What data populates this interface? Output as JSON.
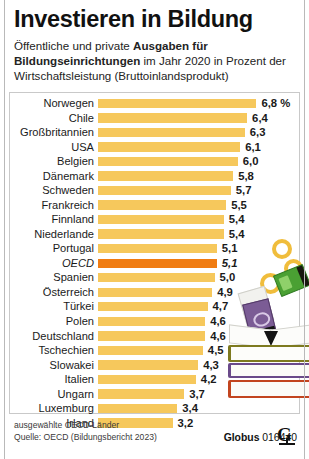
{
  "title": "Investieren in Bildung",
  "subtitle": {
    "part1": "Öffentliche und private ",
    "bold1": "Ausgaben für Bildungseinrichtungen",
    "part2": " im Jahr 2020 in Prozent der Wirtschaftsleistung (Bruttoinlandsprodukt)"
  },
  "footer": {
    "note": "ausgewählte OECD-Länder",
    "source": "Quelle: OECD (Bildungsbericht 2023)",
    "brand": "Globus",
    "id": "016440",
    "logo_icon": "globus-globe-icon"
  },
  "colors": {
    "bar": "#f6c85c",
    "highlight": "#f07c12",
    "text": "#1a1a1a"
  },
  "illustration": {
    "name": "books-and-money-illustration",
    "coins": [
      "coin-ring-1",
      "coin-ring-2",
      "coin-ring-3"
    ],
    "banknotes": [
      "green-banknote",
      "white-banknote",
      "purple-banknote"
    ],
    "books": [
      "open-book",
      "olive-book",
      "purple-book",
      "red-book"
    ]
  },
  "chart_data": {
    "type": "bar",
    "title": "Investieren in Bildung",
    "subtitle": "Öffentliche und private Ausgaben für Bildungseinrichtungen im Jahr 2020 in Prozent der Wirtschaftsleistung (Bruttoinlandsprodukt)",
    "xlabel": "",
    "ylabel": "",
    "unit": "%",
    "unit_suffix_on_first": "6,8 %",
    "orientation": "horizontal",
    "grid": false,
    "legend": false,
    "xlim": [
      0,
      6.8
    ],
    "highlight_category": "OECD",
    "categories": [
      "Norwegen",
      "Chile",
      "Großbritannien",
      "USA",
      "Belgien",
      "Dänemark",
      "Schweden",
      "Frankreich",
      "Finnland",
      "Niederlande",
      "Portugal",
      "OECD",
      "Spanien",
      "Österreich",
      "Türkei",
      "Polen",
      "Deutschland",
      "Tschechien",
      "Slowakei",
      "Italien",
      "Ungarn",
      "Luxemburg",
      "Irland"
    ],
    "values": [
      6.8,
      6.4,
      6.3,
      6.1,
      6.0,
      5.8,
      5.7,
      5.5,
      5.4,
      5.4,
      5.1,
      5.1,
      5.0,
      4.9,
      4.7,
      4.6,
      4.6,
      4.5,
      4.3,
      4.2,
      3.7,
      3.4,
      3.2
    ],
    "value_labels": [
      "6,8 %",
      "6,4",
      "6,3",
      "6,1",
      "6,0",
      "5,8",
      "5,7",
      "5,5",
      "5,4",
      "5,4",
      "5,1",
      "5,1",
      "5,0",
      "4,9",
      "4,7",
      "4,6",
      "4,6",
      "4,5",
      "4,3",
      "4,2",
      "3,7",
      "3,4",
      "3,2"
    ],
    "source": "Quelle: OECD (Bildungsbericht 2023)",
    "annotation": "ausgewählte OECD-Länder"
  }
}
